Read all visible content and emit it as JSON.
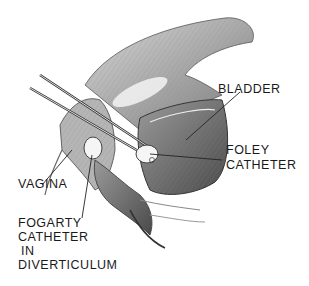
{
  "figure": {
    "type": "anatomical-illustration",
    "labels": {
      "bladder": "BLADDER",
      "foley_1": "FOLEY",
      "foley_2": "CATHETER",
      "vagina": "VAGINA",
      "fogarty_1": "FOGARTY",
      "fogarty_2": "CATHETER",
      "fogarty_3": "IN",
      "fogarty_4": "DIVERTICULUM"
    }
  }
}
